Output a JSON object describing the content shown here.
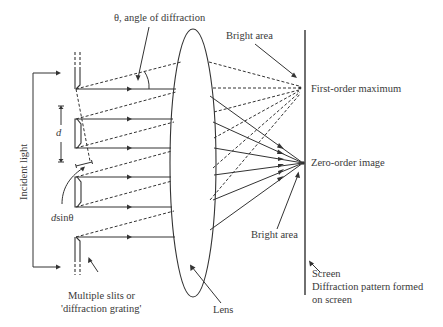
{
  "diagram": {
    "type": "diffraction-grating-optics",
    "labels": {
      "angle": "θ, angle of diffraction",
      "bright_area_top": "Bright area",
      "first_order": "First-order maximum",
      "zero_order": "Zero-order image",
      "bright_area_bottom": "Bright area",
      "incident_light": "Incident light",
      "slit_spacing": "d",
      "path_difference_d": "d",
      "path_difference_rest": "sinθ",
      "slits_line1": "Multiple slits or",
      "slits_line2": "'diffraction grating'",
      "lens": "Lens",
      "screen": "Screen",
      "pattern_line1": "Diffraction pattern formed",
      "pattern_line2": "on screen"
    },
    "colors": {
      "stroke": "#333333",
      "text": "#3a3a3a",
      "background": "#ffffff"
    }
  }
}
